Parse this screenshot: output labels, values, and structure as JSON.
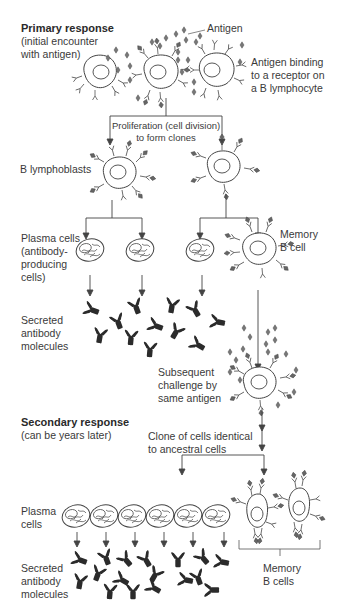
{
  "diagram": {
    "colors": {
      "line": "#444444",
      "cell": "#555555",
      "antibody": "#2b2b2b",
      "antigen": "#666666",
      "text": "#3a3a3a"
    },
    "primary": {
      "heading": "Primary response",
      "subheading": "(initial encounter\nwith antigen)",
      "antigen_label": "Antigen",
      "binding_label": "Antigen binding\nto a receptor on\na B lymphocyte",
      "proliferation_label": "Proliferation (cell division)\nto form clones",
      "lymphoblasts_label": "B lymphoblasts",
      "plasma_label": "Plasma cells\n(antibody-\nproducing\ncells)",
      "memory_label": "Memory\nB cell",
      "secreted_label": "Secreted\nantibody\nmolecules",
      "challenge_label": "Subsequent\nchallenge by\nsame antigen"
    },
    "secondary": {
      "heading": "Secondary response",
      "subheading": "(can be years later)",
      "clone_label": "Clone of cells identical\nto ancestral cells",
      "plasma_label": "Plasma\ncells",
      "secreted_label": "Secreted\nantibody\nmolecules",
      "memory_label": "Memory\nB cells",
      "plasma_cell_count": 6,
      "memory_cell_count": 2
    }
  }
}
